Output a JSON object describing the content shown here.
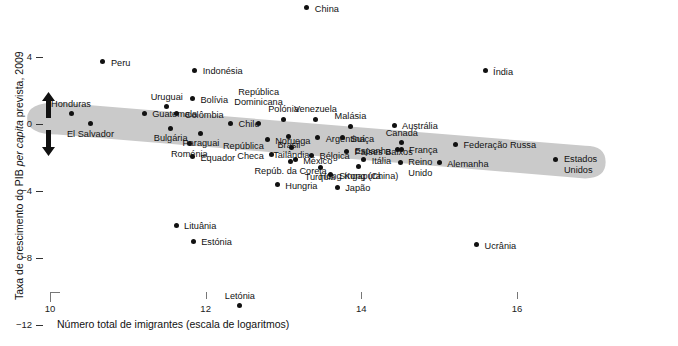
{
  "chart_data": {
    "type": "scatter",
    "title": "",
    "xlabel": "Número total de imigrantes (escala de logaritmos)",
    "ylabel": "Taxa de crescimento do PIB per capita prevista, 2009",
    "ylabel_italic_part": "per capita",
    "xlim": [
      9.6,
      17.2
    ],
    "ylim": [
      -13.2,
      8.8
    ],
    "xticks": [
      10,
      12,
      14,
      16
    ],
    "xticklabels": [
      "10",
      "12",
      "14",
      "16"
    ],
    "yticks": [
      8,
      4,
      0,
      -4,
      -8,
      -12
    ],
    "yticklabels": [
      "8",
      "4",
      "0",
      "−4",
      "−8",
      "−12"
    ],
    "grid": false,
    "legend": null,
    "annotations": {
      "up_arrow": "up-arrow",
      "down_arrow": "down-arrow",
      "trend_band": "shaded descending trend band"
    },
    "colors": {
      "point": "#111111",
      "band": "#cccccc",
      "axis": "#777777",
      "text": "#111111",
      "background": "#ffffff"
    },
    "points": [
      {
        "name": "China",
        "x": 13.3,
        "y": 6.95,
        "lx": 8,
        "ly": -4,
        "align": "r"
      },
      {
        "name": "Peru",
        "x": 10.68,
        "y": 3.72,
        "lx": 8,
        "ly": -4,
        "align": "r"
      },
      {
        "name": "Índia",
        "x": 15.59,
        "y": 3.18,
        "lx": 8,
        "ly": -4,
        "align": "r"
      },
      {
        "name": "Indonésia",
        "x": 11.86,
        "y": 3.2,
        "lx": 8,
        "ly": -4,
        "align": "r"
      },
      {
        "name": "Bolívia",
        "x": 11.83,
        "y": 1.52,
        "lx": 8,
        "ly": -4,
        "align": "r"
      },
      {
        "name": "Uruguai",
        "x": 11.5,
        "y": 1.04,
        "lx": 0,
        "ly": -15,
        "align": "c"
      },
      {
        "name": "Honduras",
        "x": 10.27,
        "y": 0.62,
        "lx": 0,
        "ly": -15,
        "align": "c"
      },
      {
        "name": "Guatemala",
        "x": 11.21,
        "y": 0.64,
        "lx": 8,
        "ly": -4,
        "align": "r"
      },
      {
        "name": "Colômbia",
        "x": 11.63,
        "y": 0.62,
        "lx": 8,
        "ly": -4,
        "align": "r"
      },
      {
        "name": "El Salvador",
        "x": 10.52,
        "y": 0.02,
        "lx": 0,
        "ly": 5,
        "align": "c"
      },
      {
        "name": "Bulgária",
        "x": 11.55,
        "y": -0.24,
        "lx": 0,
        "ly": 5,
        "align": "c"
      },
      {
        "name": "Paraguai",
        "x": 11.94,
        "y": -0.55,
        "lx": 0,
        "ly": 5,
        "align": "c"
      },
      {
        "name": "Chile",
        "x": 12.32,
        "y": 0.05,
        "lx": 8,
        "ly": -4,
        "align": "r"
      },
      {
        "name": "Roménia",
        "x": 11.79,
        "y": -1.17,
        "lx": 0,
        "ly": 5,
        "align": "c"
      },
      {
        "name": "Equador",
        "x": 11.83,
        "y": -1.95,
        "lx": 8,
        "ly": -4,
        "align": "r"
      },
      {
        "name": "República\nDominicana",
        "x": 12.68,
        "y": 0.05,
        "lx": 0,
        "ly": -26,
        "align": "c"
      },
      {
        "name": "Polónia",
        "x": 13.0,
        "y": 0.27,
        "lx": 0,
        "ly": -15,
        "align": "c"
      },
      {
        "name": "Noruega",
        "x": 12.79,
        "y": -0.95,
        "lx": 8,
        "ly": -4,
        "align": "r"
      },
      {
        "name": "Brasil",
        "x": 13.07,
        "y": -0.75,
        "lx": 0,
        "ly": 3,
        "align": "c"
      },
      {
        "name": "Tailândia",
        "x": 13.1,
        "y": -1.38,
        "lx": 0,
        "ly": 3,
        "align": "c"
      },
      {
        "name": "Venezuela",
        "x": 13.41,
        "y": 0.28,
        "lx": 0,
        "ly": -15,
        "align": "c"
      },
      {
        "name": "Argentina",
        "x": 13.44,
        "y": -0.82,
        "lx": 8,
        "ly": -4,
        "align": "r"
      },
      {
        "name": "República\nCheca",
        "x": 12.85,
        "y": -1.84,
        "lx": -8,
        "ly": -14,
        "align": "l"
      },
      {
        "name": "México",
        "x": 13.15,
        "y": -2.14,
        "lx": 8,
        "ly": -4,
        "align": "r"
      },
      {
        "name": "Repúb. da Coreia",
        "x": 13.09,
        "y": -2.25,
        "lx": 0,
        "ly": 4,
        "align": "c"
      },
      {
        "name": "Bélgica",
        "x": 13.36,
        "y": -1.88,
        "lx": 8,
        "ly": -4,
        "align": "r"
      },
      {
        "name": "Hungria",
        "x": 12.92,
        "y": -3.62,
        "lx": 8,
        "ly": -4,
        "align": "r"
      },
      {
        "name": "Malásia",
        "x": 13.86,
        "y": -0.12,
        "lx": 0,
        "ly": -15,
        "align": "c"
      },
      {
        "name": "Suíça",
        "x": 13.76,
        "y": -0.82,
        "lx": 8,
        "ly": -4,
        "align": "r"
      },
      {
        "name": "Países Baixos",
        "x": 13.81,
        "y": -1.62,
        "lx": 8,
        "ly": -4,
        "align": "r"
      },
      {
        "name": "Itália",
        "x": 14.03,
        "y": -2.12,
        "lx": 8,
        "ly": -4,
        "align": "r"
      },
      {
        "name": "Turquia",
        "x": 13.47,
        "y": -2.62,
        "lx": 0,
        "ly": 4,
        "align": "c"
      },
      {
        "name": "Hong Kong (China)",
        "x": 13.97,
        "y": -2.55,
        "lx": 0,
        "ly": 4,
        "align": "c"
      },
      {
        "name": "Singapura",
        "x": 13.61,
        "y": -3.02,
        "lx": 8,
        "ly": -4,
        "align": "r"
      },
      {
        "name": "Japão",
        "x": 13.69,
        "y": -3.78,
        "lx": 8,
        "ly": -4,
        "align": "r"
      },
      {
        "name": "Austrália",
        "x": 14.42,
        "y": -0.08,
        "lx": 8,
        "ly": -4,
        "align": "r"
      },
      {
        "name": "Canadá",
        "x": 14.52,
        "y": -1.12,
        "lx": 0,
        "ly": -15,
        "align": "c"
      },
      {
        "name": "Espanha",
        "x": 14.47,
        "y": -1.55,
        "lx": -7,
        "ly": -4,
        "align": "l"
      },
      {
        "name": "França",
        "x": 14.51,
        "y": -1.52,
        "lx": 8,
        "ly": -4,
        "align": "r"
      },
      {
        "name": "Reino\nUnido",
        "x": 14.5,
        "y": -2.28,
        "lx": 8,
        "ly": -5,
        "align": "r"
      },
      {
        "name": "Federação Russa",
        "x": 15.21,
        "y": -1.22,
        "lx": 8,
        "ly": -4,
        "align": "r"
      },
      {
        "name": "Alemanha",
        "x": 15.0,
        "y": -2.32,
        "lx": 8,
        "ly": -4,
        "align": "r"
      },
      {
        "name": "Estados\nUnidos",
        "x": 16.5,
        "y": -2.1,
        "lx": 8,
        "ly": -5,
        "align": "r"
      },
      {
        "name": "Lituânia",
        "x": 11.62,
        "y": -6.05,
        "lx": 8,
        "ly": -4,
        "align": "r"
      },
      {
        "name": "Estónia",
        "x": 11.84,
        "y": -7.0,
        "lx": 8,
        "ly": -4,
        "align": "r"
      },
      {
        "name": "Letónia",
        "x": 12.44,
        "y": -10.85,
        "lx": 0,
        "ly": -15,
        "align": "c"
      },
      {
        "name": "Ucrânia",
        "x": 15.48,
        "y": -7.22,
        "lx": 8,
        "ly": -4,
        "align": "r"
      }
    ],
    "band": {
      "note": "grey rounded band running from lower-left high to lower-right",
      "left_x": 9.89,
      "left_y_top": 1.28,
      "left_y_bot": -0.62,
      "right_x": 16.95,
      "right_y_top": -1.3,
      "right_y_bot": -3.25
    }
  },
  "axis": {
    "y_title_prefix": "Taxa de crescimento do PIB ",
    "y_title_italic": "per capita",
    "y_title_suffix": " prevista, 2009",
    "x_title": "Número total de imigrantes (escala de logaritmos)"
  }
}
